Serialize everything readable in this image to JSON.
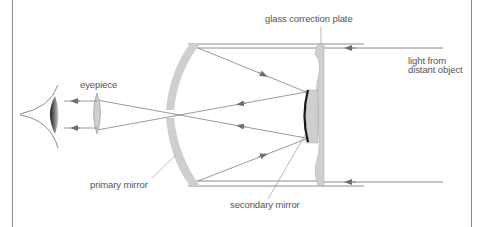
{
  "diagram": {
    "type": "catadioptric-telescope-schematic",
    "labels": {
      "correction_plate": "glass correction plate",
      "light_line1": "light from",
      "light_line2": "distant object",
      "eyepiece": "eyepiece",
      "primary_mirror": "primary mirror",
      "secondary_mirror": "secondary mirror"
    },
    "colors": {
      "line": "#6e6e6e",
      "frame": "#8a8a8a",
      "glass": "#cfcfcf",
      "mirror_face": "#1a1a1a",
      "text": "#555555"
    }
  }
}
